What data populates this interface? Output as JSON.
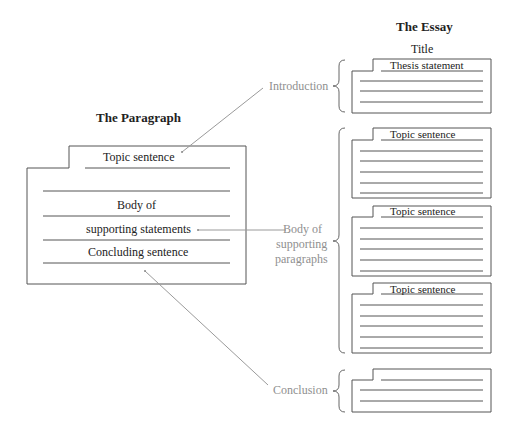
{
  "colors": {
    "ink": "#222222",
    "box_stroke": "#555555",
    "label_gray": "#8f8f8f",
    "connector": "#9a9a9a"
  },
  "paragraph": {
    "heading": "The Paragraph",
    "lines": [
      "Topic sentence",
      "Body of",
      "supporting statements",
      "Concluding sentence"
    ]
  },
  "essay": {
    "heading": "The Essay",
    "title": "Title",
    "introduction": {
      "label": "Introduction",
      "first_line": "Thesis statement"
    },
    "body": {
      "label_lines": [
        "Body of",
        "supporting",
        "paragraphs"
      ],
      "paragraphs": [
        {
          "first_line": "Topic sentence"
        },
        {
          "first_line": "Topic sentence"
        },
        {
          "first_line": "Topic sentence"
        }
      ]
    },
    "conclusion": {
      "label": "Conclusion"
    }
  }
}
